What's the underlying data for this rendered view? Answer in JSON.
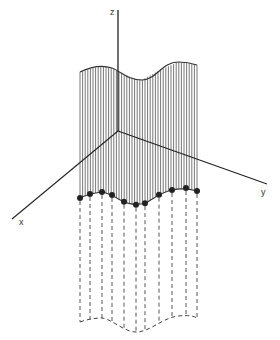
{
  "diagram": {
    "axes": {
      "x_label": "x",
      "y_label": "y",
      "z_label": "z"
    },
    "colors": {
      "line": "#333333",
      "background": "#ffffff"
    },
    "sample_points_count": 11
  }
}
